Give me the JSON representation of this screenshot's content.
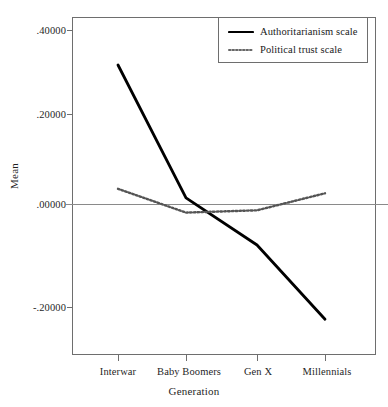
{
  "chart_data": {
    "type": "line",
    "title": "",
    "xlabel": "Generation",
    "ylabel": "Mean",
    "categories": [
      "Interwar",
      "Baby Boomers",
      "Gen X",
      "Millennials"
    ],
    "series": [
      {
        "name": "Authoritarianism scale",
        "style": "solid",
        "color": "#000000",
        "values": [
          0.31,
          0.015,
          -0.09,
          -0.255
        ]
      },
      {
        "name": "Political trust scale",
        "style": "dotted",
        "color": "#555555",
        "values": [
          0.035,
          -0.018,
          -0.013,
          0.025
        ]
      }
    ],
    "ylim": [
      -0.28,
      0.42
    ],
    "yticks": [
      0.4,
      0.2,
      0.0,
      -0.2
    ],
    "ytick_labels": [
      ".40000",
      ".20000",
      ".00000",
      "-.20000"
    ],
    "grid": false,
    "reference_line": 0.0,
    "legend_position": "top-right"
  },
  "legend": {
    "items": [
      {
        "label": "Authoritarianism scale",
        "style": "solid"
      },
      {
        "label": "Political trust scale",
        "style": "dotted"
      }
    ]
  },
  "axes": {
    "y_title": "Mean",
    "x_title": "Generation"
  }
}
